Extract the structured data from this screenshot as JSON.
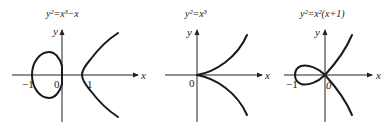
{
  "panels": [
    {
      "title": "y²=x³−x",
      "x_axis_label": "x",
      "y_axis_label": "y",
      "ticks": [
        "−1",
        "0",
        "1"
      ]
    },
    {
      "title": "y²=x³",
      "x_axis_label": "x",
      "y_axis_label": "y",
      "ticks": [
        "0"
      ]
    },
    {
      "title": "y²=x²(x+1)",
      "x_axis_label": "x",
      "y_axis_label": "y",
      "ticks": [
        "−1",
        "0"
      ]
    }
  ],
  "colors": {
    "curve": "#1a1a1a",
    "axis": "#222222",
    "background": "#ffffff"
  }
}
